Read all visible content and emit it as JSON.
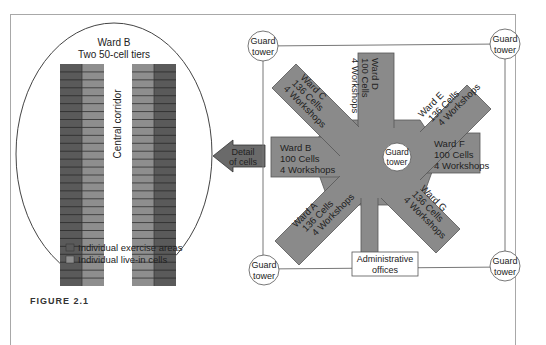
{
  "detail": {
    "title_line1": "Ward B",
    "title_line2": "Two 50-cell tiers",
    "corridor_label": "Central corridor",
    "legend": [
      {
        "label": "Individual exercise areas",
        "color": "#5a5a5a"
      },
      {
        "label": "Individual live-in cells",
        "color": "#8e8e8e"
      }
    ],
    "rows_per_column": 28
  },
  "arrow": {
    "line1": "Detail",
    "line2": "of cells"
  },
  "plan": {
    "center_tower": {
      "line1": "Guard",
      "line2": "tower"
    },
    "corner_towers": [
      {
        "line1": "Guard",
        "line2": "tower"
      },
      {
        "line1": "Guard",
        "line2": "tower"
      },
      {
        "line1": "Guard",
        "line2": "tower"
      },
      {
        "line1": "Guard",
        "line2": "tower"
      }
    ],
    "admin": {
      "line1": "Administrative",
      "line2": "offices"
    },
    "wards": [
      {
        "name": "Ward A",
        "cells": "136 Cells",
        "workshops": "4 Workshops"
      },
      {
        "name": "Ward B",
        "cells": "100 Cells",
        "workshops": "4 Workshops"
      },
      {
        "name": "Ward C",
        "cells": "136 Cells",
        "workshops": "4 Workshops"
      },
      {
        "name": "Ward D",
        "cells": "100 Cells",
        "workshops": "4 Workshops"
      },
      {
        "name": "Ward E",
        "cells": "136 Cells",
        "workshops": "4 Workshops"
      },
      {
        "name": "Ward F",
        "cells": "100 Cells",
        "workshops": "4 Workshops"
      },
      {
        "name": "Ward G",
        "cells": "136 Cells",
        "workshops": "4 Workshops"
      }
    ]
  },
  "colors": {
    "wing_fill": "#8a8a8a",
    "exercise": "#5a5a5a",
    "cells": "#8e8e8e",
    "line": "#555555"
  },
  "caption": "FIGURE 2.1"
}
